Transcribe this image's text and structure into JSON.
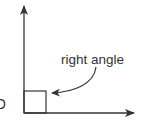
{
  "diagram": {
    "label_right_angle": "right angle",
    "vertex_label": "O",
    "colors": {
      "stroke": "#333333",
      "text": "#333333",
      "background": "#ffffff"
    },
    "elements": [
      {
        "type": "ray",
        "direction": "up",
        "from": "vertex"
      },
      {
        "type": "ray",
        "direction": "right",
        "from": "vertex"
      },
      {
        "type": "right-angle-marker",
        "shape": "square"
      },
      {
        "type": "curved-arrow",
        "points_to": "right-angle-marker"
      }
    ]
  }
}
